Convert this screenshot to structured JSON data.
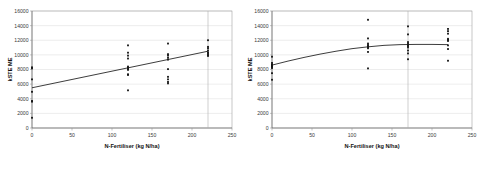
{
  "figure": {
    "background": "#ffffff",
    "point_color": "#111111",
    "line_color": "#1a1a1a",
    "grid_color": "#d2d2d2"
  },
  "chart_data": [
    {
      "type": "scatter",
      "title": "",
      "subtitle": "",
      "xlabel": "N-Fertiliser (kg N/ha)",
      "ylabel": "kSTE ME",
      "xlim": [
        0,
        250
      ],
      "ylim": [
        0,
        16000
      ],
      "xticks": [
        0,
        50,
        100,
        150,
        200,
        250
      ],
      "yticks": [
        0,
        2000,
        4000,
        6000,
        8000,
        10000,
        12000,
        14000,
        16000
      ],
      "xtick_labels": [
        "0",
        "50",
        "100",
        "150",
        "200",
        "250"
      ],
      "ytick_labels": [
        "0",
        "2000",
        "4000",
        "6000",
        "8000",
        "10000",
        "12000",
        "14000",
        "16000"
      ],
      "grid": "horizontal",
      "legend": "none",
      "annotations": [
        {
          "kind": "vertical-reference-line",
          "x": 220
        }
      ],
      "series": [
        {
          "name": "observations",
          "marker": "square",
          "points": [
            [
              0,
              8300
            ],
            [
              0,
              8150
            ],
            [
              0,
              6650
            ],
            [
              0,
              4950
            ],
            [
              0,
              3700
            ],
            [
              0,
              3600
            ],
            [
              0,
              1400
            ],
            [
              120,
              11300
            ],
            [
              120,
              10300
            ],
            [
              120,
              9900
            ],
            [
              120,
              9500
            ],
            [
              120,
              8400
            ],
            [
              120,
              8250
            ],
            [
              120,
              8100
            ],
            [
              120,
              7950
            ],
            [
              120,
              7350
            ],
            [
              120,
              7250
            ],
            [
              120,
              5150
            ],
            [
              170,
              11550
            ],
            [
              170,
              10100
            ],
            [
              170,
              9900
            ],
            [
              170,
              9600
            ],
            [
              170,
              9350
            ],
            [
              170,
              8050
            ],
            [
              170,
              7000
            ],
            [
              170,
              6650
            ],
            [
              170,
              6300
            ],
            [
              170,
              6100
            ],
            [
              220,
              12000
            ],
            [
              220,
              11100
            ],
            [
              220,
              10900
            ],
            [
              220,
              10600
            ],
            [
              220,
              10350
            ],
            [
              220,
              10200
            ],
            [
              220,
              10000
            ],
            [
              220,
              9850
            ]
          ]
        },
        {
          "name": "linear-fit",
          "kind": "line",
          "points": [
            [
              0,
              5500
            ],
            [
              220,
              10500
            ]
          ]
        }
      ]
    },
    {
      "type": "scatter",
      "title": "",
      "subtitle": "",
      "xlabel": "N-Fertiliser (kg N/ha)",
      "ylabel": "kSTE ME",
      "xlim": [
        0,
        250
      ],
      "ylim": [
        0,
        16000
      ],
      "xticks": [
        0,
        50,
        100,
        150,
        200,
        250
      ],
      "yticks": [
        0,
        2000,
        4000,
        6000,
        8000,
        10000,
        12000,
        14000,
        16000
      ],
      "xtick_labels": [
        "0",
        "50",
        "100",
        "150",
        "200",
        "250"
      ],
      "ytick_labels": [
        "0",
        "2000",
        "4000",
        "6000",
        "8000",
        "10000",
        "12000",
        "14000",
        "16000"
      ],
      "grid": "horizontal",
      "legend": "none",
      "annotations": [
        {
          "kind": "vertical-reference-line",
          "x": 170
        }
      ],
      "series": [
        {
          "name": "observations",
          "marker": "square",
          "points": [
            [
              0,
              9750
            ],
            [
              0,
              8900
            ],
            [
              0,
              8700
            ],
            [
              0,
              8600
            ],
            [
              0,
              8450
            ],
            [
              0,
              8350
            ],
            [
              0,
              8200
            ],
            [
              0,
              7500
            ],
            [
              0,
              6600
            ],
            [
              120,
              14800
            ],
            [
              120,
              12250
            ],
            [
              120,
              11550
            ],
            [
              120,
              11350
            ],
            [
              120,
              11200
            ],
            [
              120,
              11050
            ],
            [
              120,
              10900
            ],
            [
              120,
              10400
            ],
            [
              120,
              8150
            ],
            [
              170,
              13900
            ],
            [
              170,
              12800
            ],
            [
              170,
              11750
            ],
            [
              170,
              11500
            ],
            [
              170,
              11350
            ],
            [
              170,
              11200
            ],
            [
              170,
              11000
            ],
            [
              170,
              10600
            ],
            [
              170,
              10200
            ],
            [
              170,
              9400
            ],
            [
              220,
              13550
            ],
            [
              220,
              13250
            ],
            [
              220,
              12900
            ],
            [
              220,
              12200
            ],
            [
              220,
              12050
            ],
            [
              220,
              11900
            ],
            [
              220,
              11300
            ],
            [
              220,
              10800
            ],
            [
              220,
              9200
            ]
          ]
        },
        {
          "name": "quadratic-fit",
          "kind": "curve",
          "points": [
            [
              0,
              8600
            ],
            [
              20,
              9150
            ],
            [
              40,
              9650
            ],
            [
              60,
              10100
            ],
            [
              80,
              10500
            ],
            [
              100,
              10850
            ],
            [
              120,
              11100
            ],
            [
              140,
              11300
            ],
            [
              160,
              11400
            ],
            [
              180,
              11430
            ],
            [
              200,
              11430
            ],
            [
              220,
              11400
            ]
          ]
        }
      ]
    }
  ]
}
